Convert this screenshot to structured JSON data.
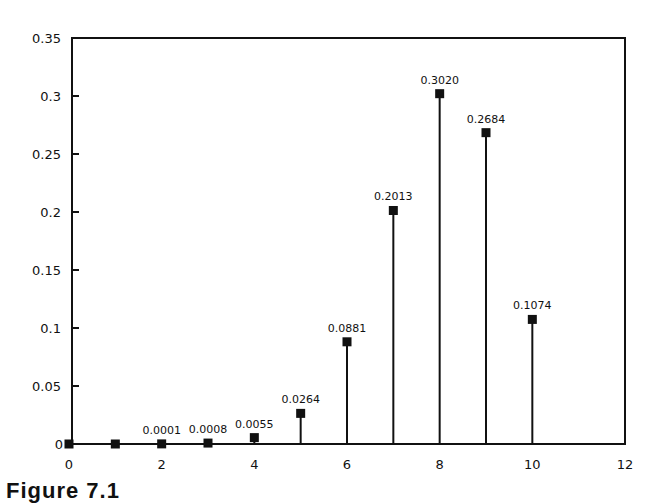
{
  "chart_data": {
    "type": "stem",
    "title": "",
    "xlabel": "",
    "ylabel": "",
    "xlim": [
      0,
      12
    ],
    "ylim": [
      0,
      0.35
    ],
    "grid": false,
    "legend": null,
    "x_ticks": [
      0,
      2,
      4,
      6,
      8,
      10,
      12
    ],
    "x_tick_labels": [
      "0",
      "2",
      "4",
      "6",
      "8",
      "10",
      "12"
    ],
    "y_ticks": [
      0,
      0.05,
      0.1,
      0.15,
      0.2,
      0.25,
      0.3,
      0.35
    ],
    "y_tick_labels": [
      "0",
      "0.05",
      "0.1",
      "0.15",
      "0.2",
      "0.25",
      "0.3",
      "0.35"
    ],
    "x": [
      0,
      1,
      2,
      3,
      4,
      5,
      6,
      7,
      8,
      9,
      10
    ],
    "values": [
      0.0,
      0.0,
      0.0001,
      0.0008,
      0.0055,
      0.0264,
      0.0881,
      0.2013,
      0.302,
      0.2684,
      0.1074
    ],
    "data_labels": [
      "",
      "",
      "0.0001",
      "0.0008",
      "0.0055",
      "0.0264",
      "0.0881",
      "0.2013",
      "0.3020",
      "0.2684",
      "0.1074"
    ],
    "marker": "square",
    "color": "#111111"
  },
  "caption": "Figure 7.1"
}
